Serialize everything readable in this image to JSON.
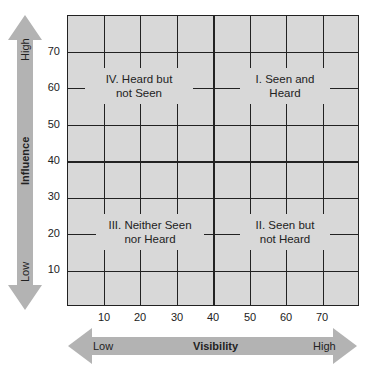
{
  "diagram": {
    "type": "quadrant-grid",
    "grid_color": "#d8d8d8",
    "line_color": "#222222",
    "arrow_color": "#b3b3b3",
    "x_axis": {
      "title": "Visibility",
      "low_label": "Low",
      "high_label": "High",
      "ticks": [
        "10",
        "20",
        "30",
        "40",
        "50",
        "60",
        "70"
      ]
    },
    "y_axis": {
      "title": "Influence",
      "low_label": "Low",
      "high_label": "High",
      "ticks": [
        "70",
        "60",
        "50",
        "40",
        "30",
        "20",
        "10"
      ]
    },
    "quadrants": [
      {
        "id": "IV",
        "line1": "IV. Heard but",
        "line2": "not Seen"
      },
      {
        "id": "I",
        "line1": "I. Seen and",
        "line2": "Heard"
      },
      {
        "id": "III",
        "line1": "III. Neither Seen",
        "line2": "nor Heard"
      },
      {
        "id": "II",
        "line1": "II. Seen but",
        "line2": "not Heard"
      }
    ]
  }
}
